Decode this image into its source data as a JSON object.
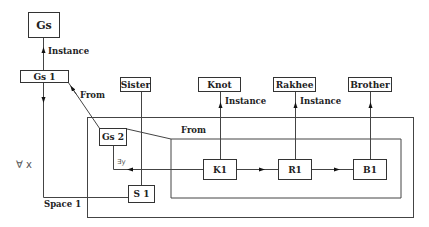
{
  "diagram": {
    "type": "semantic-network",
    "nodes": {
      "gs": "Gs",
      "gs1": "Gs 1",
      "gs2": "Gs 2",
      "sister": "Sister",
      "knot": "Knot",
      "rakhee": "Rakhee",
      "brother": "Brother",
      "s1": "S 1",
      "k1": "K1",
      "r1": "R1",
      "b1": "B1"
    },
    "labels": {
      "instance_gs": "Instance",
      "from_gs1": "From",
      "from_gs2": "From",
      "instance_knot": "Instance",
      "instance_rakhee": "Instance",
      "forall_x": "∀ x",
      "exists_y": "∃y",
      "space1": "Space 1"
    },
    "edges": [
      {
        "from": "Gs 1",
        "to": "Gs",
        "label": "Instance"
      },
      {
        "from": "Gs 2",
        "to": "Gs 1",
        "label": "From"
      },
      {
        "from": "K1",
        "to": "Knot",
        "label": "Instance"
      },
      {
        "from": "R1",
        "to": "Rakhee",
        "label": "Instance"
      },
      {
        "from": "B1",
        "to": "Brother",
        "label": ""
      },
      {
        "from": "K1",
        "to": "R1",
        "label": ""
      },
      {
        "from": "R1",
        "to": "B1",
        "label": ""
      },
      {
        "from": "K1",
        "to": "S 1 line",
        "label": "∃y"
      },
      {
        "from": "Sister",
        "to": "S 1",
        "label": ""
      },
      {
        "from": "Gs 1",
        "to": "S 1",
        "label": "∀ x"
      }
    ]
  }
}
